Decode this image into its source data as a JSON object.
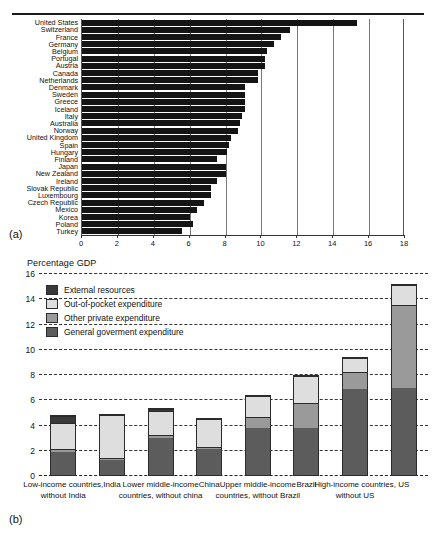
{
  "figure": {
    "panel_a_label": "(a)",
    "panel_b_label": "(b)"
  },
  "chart_data": [
    {
      "id": "panel-a",
      "type": "bar",
      "orientation": "horizontal",
      "title": "",
      "xlabel": "",
      "ylabel": "",
      "xlim": [
        0,
        18
      ],
      "xticks": [
        0,
        2,
        4,
        6,
        8,
        10,
        12,
        14,
        16,
        18
      ],
      "grid": true,
      "legend": "none",
      "categories": [
        "United States",
        "Switzerland",
        "France",
        "Germany",
        "Belgium",
        "Portugal",
        "Austria",
        "Canada",
        "Netherlands",
        "Denmark",
        "Sweden",
        "Greece",
        "Iceland",
        "Italy",
        "Australia",
        "Norway",
        "United Kingdom",
        "Spain",
        "Hungary",
        "Finland",
        "Japan",
        "New Zealand",
        "Ireland",
        "Slovak Republic",
        "Luxembourg",
        "Czech Republic",
        "Mexico",
        "Korea",
        "Poland",
        "Turkey"
      ],
      "values": [
        15.3,
        11.6,
        11.1,
        10.7,
        10.3,
        10.2,
        10.2,
        9.8,
        9.8,
        9.1,
        9.1,
        9.1,
        9.1,
        8.9,
        8.8,
        8.7,
        8.3,
        8.2,
        8.1,
        7.5,
        8.0,
        8.0,
        7.5,
        7.2,
        7.2,
        6.8,
        6.4,
        6.0,
        6.2,
        5.6
      ]
    },
    {
      "id": "panel-b",
      "type": "bar",
      "stacked": true,
      "title": "Percentage GDP",
      "xlabel": "",
      "ylabel": "Percentage GDP",
      "ylim": [
        0,
        16
      ],
      "yticks": [
        0,
        2,
        4,
        6,
        8,
        10,
        12,
        14,
        16
      ],
      "grid": true,
      "legend_position": "upper-left",
      "categories": [
        "Low-income countries, without India",
        "India",
        "Lower middle-income countries, without china",
        "China",
        "Upper middle-income countries, without Brazil",
        "Brazil",
        "High-income countries, without US",
        "US"
      ],
      "series": [
        {
          "name": "General goverment expenditure",
          "color": "#5c5c5c",
          "values": [
            1.9,
            1.2,
            3.0,
            2.1,
            3.8,
            3.8,
            6.9,
            7.0
          ]
        },
        {
          "name": "Other private expenditure",
          "color": "#9a9a9a",
          "values": [
            0.2,
            0.2,
            0.3,
            0.2,
            0.9,
            2.0,
            1.4,
            6.6
          ]
        },
        {
          "name": "Out-of-pocket expenditure",
          "color": "#dedede",
          "values": [
            2.2,
            3.5,
            1.9,
            2.3,
            1.7,
            2.2,
            1.1,
            1.6
          ]
        },
        {
          "name": "External resources",
          "color": "#3a3a3a",
          "values": [
            0.5,
            0.0,
            0.2,
            0.0,
            0.0,
            0.0,
            0.0,
            0.0
          ]
        }
      ],
      "totals": [
        4.8,
        4.9,
        5.4,
        4.6,
        6.4,
        8.0,
        9.4,
        15.2
      ]
    }
  ]
}
